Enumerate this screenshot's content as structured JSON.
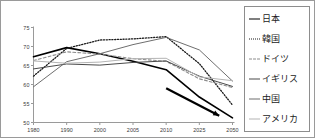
{
  "chart_data": {
    "type": "line",
    "title": "",
    "xlabel": "",
    "ylabel": "",
    "x": [
      "1980",
      "1990",
      "2000",
      "2005",
      "2010",
      "2025",
      "2050"
    ],
    "categories": [
      "1980",
      "1990",
      "2000",
      "2005",
      "2010",
      "2025",
      "2050"
    ],
    "ylim": [
      50,
      75
    ],
    "yticks": [
      50,
      55,
      60,
      65,
      70,
      75
    ],
    "ytick_labels": [
      "50",
      "55",
      "60",
      "65",
      "70",
      "75"
    ],
    "xtick_labels": [
      "1980",
      "1990",
      "2000",
      "2005",
      "2010",
      "2025",
      "2050"
    ],
    "grid": false,
    "legend_position": "right",
    "series": [
      {
        "name": "日本",
        "color": "#000000",
        "style": "solid",
        "width": 1.6,
        "values": [
          67.3,
          69.7,
          68.1,
          66.1,
          63.9,
          56.7,
          51.2
        ]
      },
      {
        "name": "韓国",
        "color": "#1a1a1a",
        "style": "dotted",
        "width": 1.3,
        "values": [
          62.2,
          69.5,
          71.7,
          72.0,
          72.6,
          65.5,
          54.6
        ]
      },
      {
        "name": "ドイツ",
        "color": "#8c8c8c",
        "style": "dashed",
        "width": 1.1,
        "values": [
          66.3,
          68.6,
          68.0,
          66.8,
          66.1,
          61.5,
          59.2
        ]
      },
      {
        "name": "イギリス",
        "color": "#4a4a4a",
        "style": "solid",
        "width": 1.0,
        "values": [
          64.1,
          65.4,
          65.1,
          65.8,
          66.2,
          62.2,
          59.5
        ]
      },
      {
        "name": "中国",
        "color": "#6e6e6e",
        "style": "solid",
        "width": 1.0,
        "values": [
          59.4,
          66.0,
          68.1,
          70.5,
          72.4,
          69.1,
          60.9
        ]
      },
      {
        "name": "アメリカ",
        "color": "#b4b4b4",
        "style": "solid",
        "width": 1.0,
        "values": [
          66.2,
          65.6,
          65.9,
          66.8,
          66.9,
          62.0,
          61.0
        ]
      }
    ],
    "annotations": [
      {
        "type": "arrow",
        "label": "",
        "color": "#000000",
        "from": {
          "x": "2010",
          "y": 59.0
        },
        "to": {
          "x": "2040",
          "y": 51.8
        }
      }
    ]
  },
  "legend": {
    "items": [
      {
        "label": "日本",
        "color": "#000000",
        "style": "solid"
      },
      {
        "label": "韓国",
        "color": "#1a1a1a",
        "style": "dotted"
      },
      {
        "label": "ドイツ",
        "color": "#8c8c8c",
        "style": "dashed"
      },
      {
        "label": "イギリス",
        "color": "#4a4a4a",
        "style": "solid"
      },
      {
        "label": "中国",
        "color": "#6e6e6e",
        "style": "solid"
      },
      {
        "label": "アメリカ",
        "color": "#b4b4b4",
        "style": "solid"
      }
    ]
  },
  "axis": {
    "y_labels": [
      "75",
      "70",
      "65",
      "60",
      "55",
      "50"
    ],
    "x_labels": [
      "1980",
      "1990",
      "2000",
      "2005",
      "2010",
      "2025",
      "2050"
    ]
  }
}
